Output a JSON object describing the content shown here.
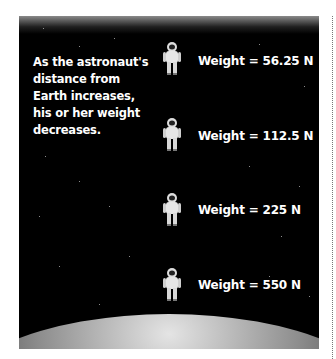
{
  "figure": {
    "caption": "As the astronaut's distance from Earth increases, his or her weight decreases.",
    "caption_lines": [
      "As the astronaut's",
      "distance from",
      "Earth increases,",
      "his or her weight",
      "decreases."
    ],
    "astronauts": [
      {
        "label": "Weight = 56.25 N",
        "weight_value": 56.25,
        "unit": "N",
        "position": "farthest"
      },
      {
        "label": "Weight = 112.5 N",
        "weight_value": 112.5,
        "unit": "N",
        "position": "far"
      },
      {
        "label": "Weight = 225 N",
        "weight_value": 225,
        "unit": "N",
        "position": "near"
      },
      {
        "label": "Weight = 550 N",
        "weight_value": 550,
        "unit": "N",
        "position": "on-surface"
      }
    ],
    "background": "space-with-stars",
    "planet": "Earth",
    "colors": {
      "panel": "#000000",
      "text": "#ffffff",
      "planet": "#9a9a9a"
    }
  }
}
